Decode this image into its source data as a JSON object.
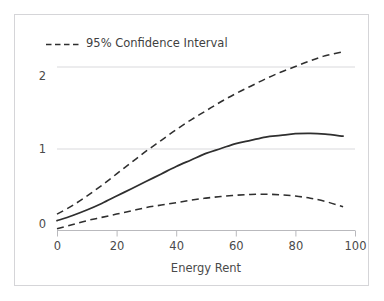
{
  "chart_data": {
    "type": "line",
    "title": "",
    "xlabel": "Energy Rent",
    "ylabel": "",
    "xlim": [
      0,
      100
    ],
    "ylim": [
      -0.08,
      2.35
    ],
    "xticks": [
      0,
      20,
      40,
      60,
      80,
      100
    ],
    "xtick_labels": [
      "0",
      "20",
      "40",
      "60",
      "80",
      "100"
    ],
    "yticks": [
      0,
      1,
      2
    ],
    "ytick_labels": [
      "0",
      "1",
      "2"
    ],
    "grid": "horizontal",
    "grid_color": "#d9d9dc",
    "legend_position": "top-left",
    "legend": [
      {
        "label": "95% Confidence Interval",
        "style": "dashed",
        "color": "#2f2f2f"
      }
    ],
    "series": [
      {
        "name": "Marginal effect",
        "style": "solid",
        "color": "#2f2f2f",
        "x": [
          0,
          5,
          10,
          15,
          20,
          25,
          30,
          35,
          40,
          45,
          50,
          55,
          60,
          65,
          70,
          75,
          80,
          85,
          90,
          96
        ],
        "y": [
          0.12,
          0.18,
          0.25,
          0.33,
          0.42,
          0.51,
          0.6,
          0.69,
          0.78,
          0.86,
          0.94,
          1.0,
          1.06,
          1.1,
          1.14,
          1.16,
          1.18,
          1.185,
          1.175,
          1.15
        ]
      },
      {
        "name": "Upper 95% bound",
        "style": "dashed",
        "color": "#2f2f2f",
        "x": [
          0,
          5,
          10,
          15,
          20,
          25,
          30,
          35,
          40,
          45,
          50,
          55,
          60,
          65,
          70,
          75,
          80,
          85,
          90,
          96
        ],
        "y": [
          0.2,
          0.3,
          0.42,
          0.55,
          0.69,
          0.83,
          0.97,
          1.1,
          1.23,
          1.35,
          1.46,
          1.57,
          1.67,
          1.76,
          1.85,
          1.93,
          2.0,
          2.07,
          2.13,
          2.18
        ]
      },
      {
        "name": "Lower 95% bound",
        "style": "dashed",
        "color": "#2f2f2f",
        "x": [
          0,
          5,
          10,
          15,
          20,
          25,
          30,
          35,
          40,
          45,
          50,
          55,
          60,
          65,
          70,
          75,
          80,
          85,
          90,
          96
        ],
        "y": [
          0.02,
          0.07,
          0.12,
          0.16,
          0.2,
          0.24,
          0.28,
          0.31,
          0.34,
          0.37,
          0.395,
          0.415,
          0.43,
          0.44,
          0.442,
          0.436,
          0.42,
          0.394,
          0.355,
          0.29
        ]
      }
    ]
  },
  "axis": {
    "x_title": "Energy Rent",
    "x_tick_0": "0",
    "x_tick_1": "20",
    "x_tick_2": "40",
    "x_tick_3": "60",
    "x_tick_4": "80",
    "x_tick_5": "100",
    "y_tick_0": "0",
    "y_tick_1": "1",
    "y_tick_2": "2"
  },
  "legend": {
    "ci_label": "95% Confidence Interval"
  }
}
